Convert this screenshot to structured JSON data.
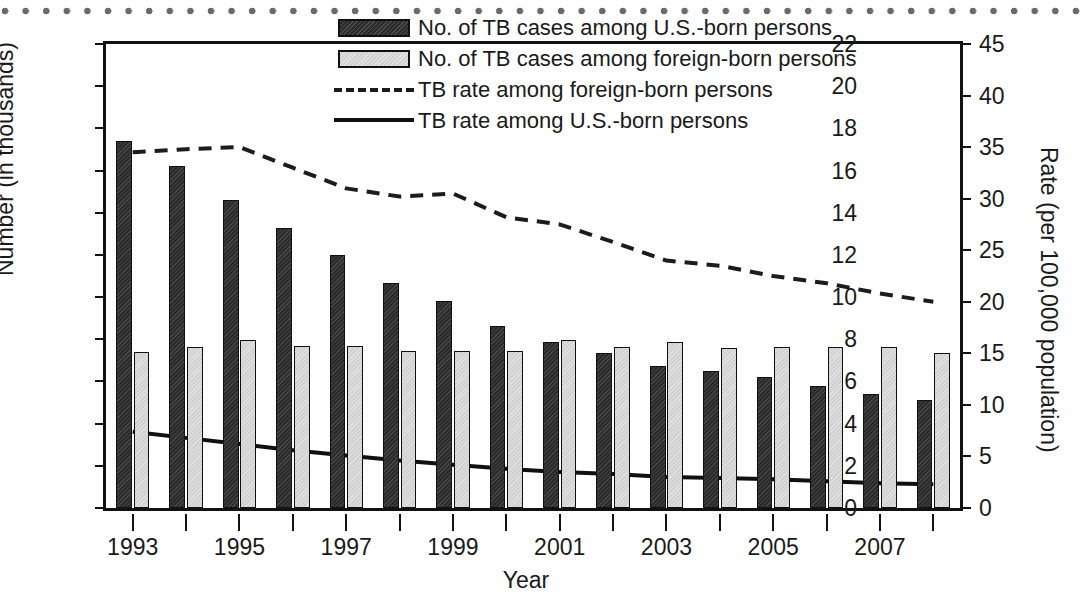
{
  "chart_data": {
    "type": "bar",
    "title": "",
    "xlabel": "Year",
    "ylabel": "Number (in thousands)",
    "y2label": "Rate (per 100,000 population)",
    "grid": false,
    "legend_position": "top-center",
    "categories": [
      1993,
      1994,
      1995,
      1996,
      1997,
      1998,
      1999,
      2000,
      2001,
      2002,
      2003,
      2004,
      2005,
      2006,
      2007,
      2008
    ],
    "xtick_labels": [
      "1993",
      "1995",
      "1997",
      "1999",
      "2001",
      "2003",
      "2005",
      "2007"
    ],
    "xtick_years": [
      1993,
      1995,
      1997,
      1999,
      2001,
      2003,
      2005,
      2007
    ],
    "ylim": [
      0,
      22
    ],
    "yticks": [
      0,
      2,
      4,
      6,
      8,
      10,
      12,
      14,
      16,
      18,
      20,
      22
    ],
    "ytick_labels": [
      "0",
      "2",
      "4",
      "6",
      "8",
      "10",
      "12",
      "14",
      "16",
      "18",
      "20",
      "22"
    ],
    "y2lim": [
      0,
      45
    ],
    "y2ticks": [
      0,
      5,
      10,
      15,
      20,
      25,
      30,
      35,
      40,
      45
    ],
    "y2tick_labels": [
      "0",
      "5",
      "10",
      "15",
      "20",
      "25",
      "30",
      "35",
      "40",
      "45"
    ],
    "series": [
      {
        "name": "No. of TB cases among U.S.-born persons",
        "kind": "bar",
        "axis": "left",
        "color": "#2b2b2b",
        "values": [
          17.4,
          16.2,
          14.6,
          13.3,
          12.0,
          10.65,
          9.8,
          8.65,
          7.85,
          7.35,
          6.75,
          6.5,
          6.2,
          5.8,
          5.4,
          5.1
        ]
      },
      {
        "name": "No. of TB cases among foreign-born persons",
        "kind": "bar",
        "axis": "left",
        "color": "#d2d2d2",
        "values": [
          7.4,
          7.65,
          7.95,
          7.7,
          7.7,
          7.45,
          7.45,
          7.45,
          7.95,
          7.65,
          7.85,
          7.6,
          7.65,
          7.65,
          7.65,
          7.35
        ]
      },
      {
        "name": "TB rate among foreign-born persons",
        "kind": "line",
        "style": "dashed",
        "axis": "right",
        "color": "#1c1c1c",
        "values": [
          34.5,
          34.8,
          35.0,
          33.0,
          31.0,
          30.2,
          30.5,
          28.2,
          27.5,
          25.8,
          24.0,
          23.5,
          22.5,
          21.8,
          20.8,
          20.0
        ]
      },
      {
        "name": "TB rate among U.S.-born persons",
        "kind": "line",
        "style": "solid",
        "axis": "right",
        "color": "#101010",
        "values": [
          7.4,
          6.8,
          6.2,
          5.6,
          5.1,
          4.6,
          4.2,
          3.8,
          3.5,
          3.3,
          3.0,
          2.9,
          2.8,
          2.6,
          2.4,
          2.3
        ]
      }
    ]
  },
  "legend": {
    "items": [
      {
        "key": "swatch-dark",
        "label": "No. of TB cases among U.S.-born persons"
      },
      {
        "key": "swatch-light",
        "label": "No. of TB cases among foreign-born persons"
      },
      {
        "key": "dashed-line",
        "label": "TB rate among foreign-born persons"
      },
      {
        "key": "solid-line",
        "label": "TB rate among U.S.-born persons"
      }
    ]
  }
}
